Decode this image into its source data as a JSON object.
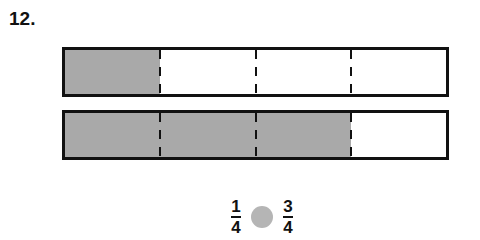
{
  "question": {
    "number": "12."
  },
  "bars": [
    {
      "parts": 4,
      "shaded": 1,
      "shaded_color": "#a9a9a9"
    },
    {
      "parts": 4,
      "shaded": 3,
      "shaded_color": "#a9a9a9"
    }
  ],
  "comparison": {
    "left": {
      "numerator": "1",
      "denominator": "4"
    },
    "right": {
      "numerator": "3",
      "denominator": "4"
    },
    "blank_color": "#b5b5b5"
  }
}
